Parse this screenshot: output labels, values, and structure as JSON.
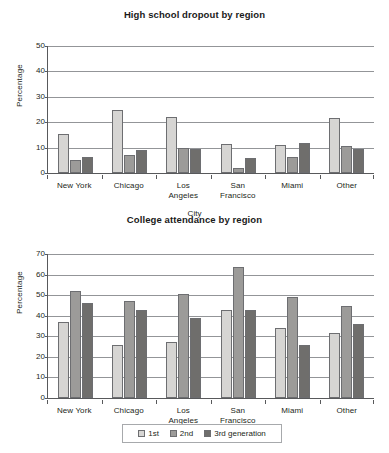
{
  "chart_data": [
    {
      "type": "bar",
      "id": "high-school-dropout",
      "title": "High school dropout by region",
      "xlabel": "City",
      "ylabel": "Percentage",
      "ylim": [
        0,
        50
      ],
      "ytick_step": 10,
      "yticks": [
        "0",
        "10",
        "20",
        "30",
        "40",
        "50"
      ],
      "grid": true,
      "legend_position": "bottom-shared",
      "categories": [
        "New York",
        "Chicago",
        "Los Angeles",
        "San Francisco",
        "Miami",
        "Other"
      ],
      "category_lines": [
        [
          "New York"
        ],
        [
          "Chicago"
        ],
        [
          "Los",
          "Angeles"
        ],
        [
          "San",
          "Francisco"
        ],
        [
          "Miami"
        ],
        [
          "Other"
        ]
      ],
      "series": [
        {
          "name": "1st",
          "color": "#d6d5d3",
          "values": [
            15.5,
            25.0,
            22.0,
            11.5,
            11.0,
            21.5
          ]
        },
        {
          "name": "2nd",
          "color": "#9c9b99",
          "values": [
            5.0,
            7.0,
            10.0,
            2.0,
            6.5,
            10.5
          ]
        },
        {
          "name": "3rd generation",
          "color": "#6f6e6c",
          "values": [
            6.5,
            9.0,
            9.5,
            6.0,
            12.0,
            9.5
          ]
        }
      ]
    },
    {
      "type": "bar",
      "id": "college-attendance",
      "title": "College attendance by region",
      "xlabel": "City",
      "ylabel": "Percentage",
      "ylim": [
        0,
        70
      ],
      "ytick_step": 10,
      "yticks": [
        "0",
        "10",
        "20",
        "30",
        "40",
        "50",
        "60",
        "70"
      ],
      "grid": true,
      "legend_position": "bottom-shared",
      "categories": [
        "New York",
        "Chicago",
        "Los Angeles",
        "San Francisco",
        "Miami",
        "Other"
      ],
      "category_lines": [
        [
          "New York"
        ],
        [
          "Chicago"
        ],
        [
          "Los",
          "Angeles"
        ],
        [
          "San",
          "Francisco"
        ],
        [
          "Miami"
        ],
        [
          "Other"
        ]
      ],
      "series": [
        {
          "name": "1st",
          "color": "#d6d5d3",
          "values": [
            37.0,
            26.0,
            27.0,
            43.0,
            34.0,
            31.5
          ]
        },
        {
          "name": "2nd",
          "color": "#9c9b99",
          "values": [
            52.0,
            47.0,
            50.5,
            63.5,
            49.0,
            44.5
          ]
        },
        {
          "name": "3rd generation",
          "color": "#6f6e6c",
          "values": [
            46.0,
            43.0,
            39.0,
            43.0,
            26.0,
            36.0
          ]
        }
      ]
    }
  ],
  "legend": {
    "items": [
      {
        "label": "1st",
        "color": "#d6d5d3"
      },
      {
        "label": "2nd",
        "color": "#9c9b99"
      },
      {
        "label": "3rd generation",
        "color": "#6f6e6c"
      }
    ]
  }
}
